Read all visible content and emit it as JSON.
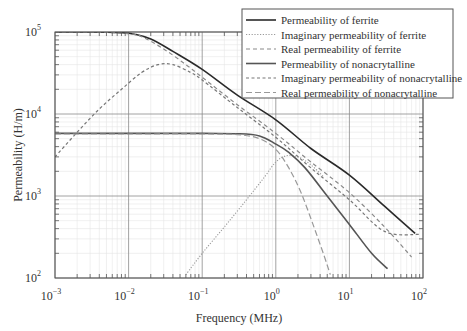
{
  "chart_data": {
    "type": "line",
    "title": "",
    "xlabel": "Frequency (MHz)",
    "ylabel": "Permeability (H/m)",
    "xscale": "log",
    "yscale": "log",
    "xlim": [
      0.001,
      100
    ],
    "ylim": [
      100,
      100000
    ],
    "grid": true,
    "legend_position": "upper right",
    "x_ticks": [
      {
        "base": "10",
        "exp": "−3",
        "value": 0.001
      },
      {
        "base": "10",
        "exp": "−2",
        "value": 0.01
      },
      {
        "base": "10",
        "exp": "−1",
        "value": 0.1
      },
      {
        "base": "10",
        "exp": "0",
        "value": 1
      },
      {
        "base": "10",
        "exp": "1",
        "value": 10
      },
      {
        "base": "10",
        "exp": "2",
        "value": 100
      }
    ],
    "y_ticks": [
      {
        "base": "10",
        "exp": "2",
        "value": 100
      },
      {
        "base": "10",
        "exp": "3",
        "value": 1000
      },
      {
        "base": "10",
        "exp": "4",
        "value": 10000
      },
      {
        "base": "10",
        "exp": "5",
        "value": 100000
      }
    ],
    "series": [
      {
        "name": "Permeability of ferrite",
        "style": "solid",
        "color": "#2a2a2a",
        "width": 1.6,
        "x": [
          0.001,
          0.003,
          0.008,
          0.012,
          0.02,
          0.04,
          0.1,
          0.3,
          1,
          3,
          10,
          30,
          78
        ],
        "y": [
          100000,
          100000,
          98000,
          94000,
          82000,
          58000,
          35000,
          17000,
          8500,
          3800,
          1800,
          750,
          350
        ]
      },
      {
        "name": "Imaginary permeability of ferrite",
        "style": "dotted",
        "color": "#9a9a9a",
        "width": 1.1,
        "x": [
          0.06,
          0.1,
          0.2,
          0.4,
          0.7,
          1.0,
          1.4,
          2.0,
          3.0,
          4.5
        ],
        "y": [
          110,
          200,
          420,
          900,
          1700,
          2600,
          3100,
          3000,
          2400,
          1700
        ]
      },
      {
        "name": "Real permeability of ferrite",
        "style": "dashed",
        "color": "#8a8a8a",
        "width": 1.2,
        "x": [
          0.001,
          0.005,
          0.01,
          0.015,
          0.03,
          0.06,
          0.1,
          0.3,
          1,
          3,
          10,
          30,
          70
        ],
        "y": [
          100000,
          99000,
          95000,
          88000,
          62000,
          40000,
          28000,
          13000,
          5800,
          2600,
          1100,
          420,
          180
        ]
      },
      {
        "name": "Permeability of nonacrytalline",
        "style": "solid",
        "color": "#555555",
        "width": 1.6,
        "x": [
          0.001,
          0.01,
          0.1,
          0.3,
          0.6,
          1,
          1.5,
          2.5,
          5,
          10,
          20,
          33
        ],
        "y": [
          5800,
          5800,
          5800,
          5750,
          5400,
          4300,
          3400,
          2200,
          1000,
          450,
          200,
          130
        ]
      },
      {
        "name": "Imaginary permeability of nonacrytalline",
        "style": "short-dashed",
        "color": "#777777",
        "width": 1.2,
        "x": [
          0.001,
          0.002,
          0.004,
          0.008,
          0.015,
          0.025,
          0.04,
          0.07,
          0.1,
          0.3,
          1,
          3,
          10,
          30,
          90
        ],
        "y": [
          3000,
          6000,
          11500,
          20000,
          32000,
          40000,
          40000,
          32000,
          26000,
          12000,
          5200,
          2200,
          900,
          370,
          340
        ]
      },
      {
        "name": "Real permeability of nonacrytalline",
        "style": "long-dashed",
        "color": "#999999",
        "width": 1.2,
        "x": [
          0.001,
          0.01,
          0.1,
          0.3,
          0.6,
          1,
          1.5,
          2.2,
          3.2,
          4.5,
          5.5
        ],
        "y": [
          5700,
          5700,
          5700,
          5600,
          5000,
          3700,
          2200,
          1100,
          450,
          190,
          110
        ]
      }
    ]
  }
}
